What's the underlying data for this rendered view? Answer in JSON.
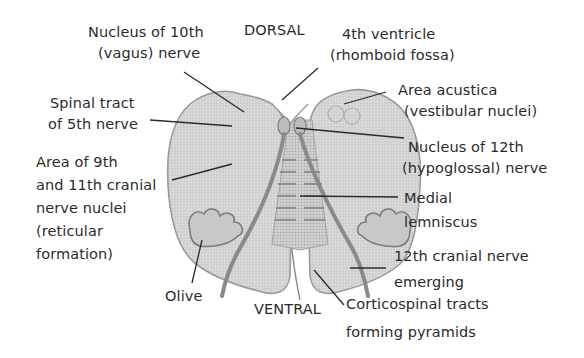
{
  "diagram": {
    "orientation": {
      "top": "DORSAL",
      "bottom": "VENTRAL"
    },
    "labels": [
      {
        "id": "nucleus-10th",
        "lines": [
          "Nucleus of 10th",
          "(vagus) nerve"
        ]
      },
      {
        "id": "fourth-ventricle",
        "lines": [
          "4th ventricle",
          "(rhomboid fossa)"
        ]
      },
      {
        "id": "area-acustica",
        "lines": [
          "Area acustica",
          "(vestibular nuclei)"
        ]
      },
      {
        "id": "spinal-tract-5th",
        "lines": [
          "Spinal tract",
          "of 5th nerve"
        ]
      },
      {
        "id": "nucleus-12th",
        "lines": [
          "Nucleus of 12th",
          "(hypoglossal) nerve"
        ]
      },
      {
        "id": "area-9th-11th",
        "lines": [
          "Area of 9th",
          "and 11th cranial",
          "nerve nuclei",
          "(reticular",
          "formation)"
        ]
      },
      {
        "id": "medial-lemniscus",
        "lines": [
          "Medial",
          "lemniscus"
        ]
      },
      {
        "id": "twelfth-cranial-emerging",
        "lines": [
          "12th cranial nerve",
          "emerging"
        ]
      },
      {
        "id": "olive",
        "lines": [
          "Olive"
        ]
      },
      {
        "id": "corticospinal",
        "lines": [
          "Corticospinal tracts",
          "forming pyramids"
        ]
      }
    ]
  }
}
